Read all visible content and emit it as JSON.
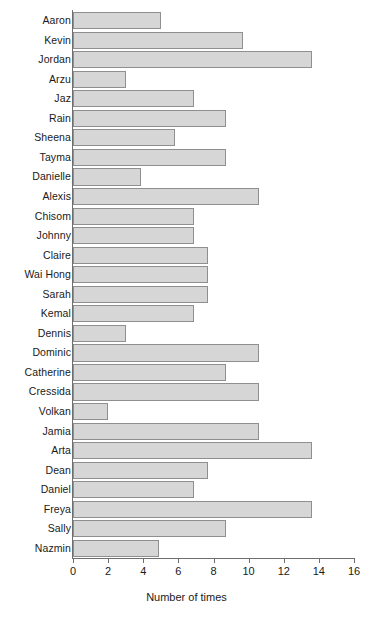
{
  "chart_data": {
    "type": "bar",
    "orientation": "horizontal",
    "title": "",
    "xlabel": "Number of times",
    "ylabel": "",
    "xlim": [
      0,
      16
    ],
    "xticks": [
      0,
      2,
      4,
      6,
      8,
      10,
      12,
      14,
      16
    ],
    "grid": false,
    "legend": null,
    "bar_fill_color": "#d6d6d6",
    "bar_border_color": "#8f8f8f",
    "axis_color": "#6e6e6e",
    "categories": [
      "Aaron",
      "Kevin",
      "Jordan",
      "Arzu",
      "Jaz",
      "Rain",
      "Sheena",
      "Tayma",
      "Danielle",
      "Alexis",
      "Chisom",
      "Johnny",
      "Claire",
      "Wai Hong",
      "Sarah",
      "Kemal",
      "Dennis",
      "Dominic",
      "Catherine",
      "Cressida",
      "Volkan",
      "Jamia",
      "Arta",
      "Dean",
      "Daniel",
      "Freya",
      "Sally",
      "Nazmin"
    ],
    "values": [
      5,
      9.7,
      13.6,
      3,
      6.9,
      8.7,
      5.8,
      8.7,
      3.9,
      10.6,
      6.9,
      6.9,
      7.7,
      7.7,
      7.7,
      6.9,
      3,
      10.6,
      8.7,
      10.6,
      2,
      10.6,
      13.6,
      7.7,
      6.9,
      13.6,
      8.7,
      4.9
    ]
  }
}
